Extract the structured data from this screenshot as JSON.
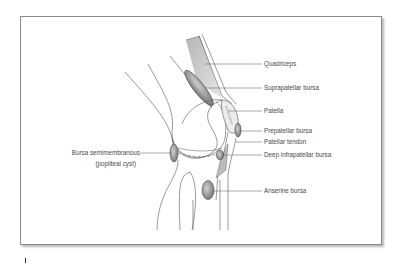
{
  "figure": {
    "colors": {
      "frame_border": "#8a8a8a",
      "line": "#555555",
      "label_text": "#4a4a4a",
      "bursa_fill": "#9a9a9a",
      "muscle_fill": "#c8c8c8"
    }
  },
  "labels": {
    "quadriceps": "Quadriceps",
    "suprapatellar_bursa": "Suprapatellar bursa",
    "patella": "Patella",
    "prepatellar_bursa": "Prepatellar bursa",
    "patellar_tendon": "Patellar tendon",
    "deep_infrapatellar_bursa": "Deep infrapatellar bursa",
    "anserine_bursa": "Anserine bursa",
    "bursa_semimembranous": "Bursa semimembranous",
    "popliteal_cyst": "(popliteal cyst)"
  }
}
